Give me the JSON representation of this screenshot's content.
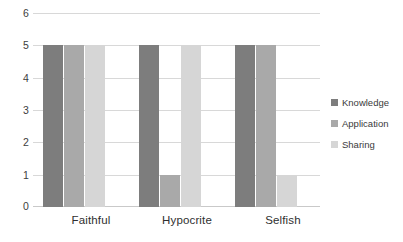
{
  "chart_data": {
    "type": "bar",
    "title": "",
    "subtitle": "",
    "xlabel": "",
    "ylabel": "",
    "categories": [
      "Faithful",
      "Hypocrite",
      "Selfish"
    ],
    "series": [
      {
        "name": "Knowledge",
        "color": "#7d7d7d",
        "values": [
          5,
          5,
          5
        ]
      },
      {
        "name": "Application",
        "color": "#a9a9a9",
        "values": [
          5,
          1,
          5
        ]
      },
      {
        "name": "Sharing",
        "color": "#d6d6d6",
        "values": [
          5,
          5,
          1
        ]
      }
    ],
    "ylim": [
      0,
      6
    ],
    "y_ticks": [
      0,
      1,
      2,
      3,
      4,
      5,
      6
    ],
    "y_tick_labels": [
      "0",
      "1",
      "2",
      "3",
      "4",
      "5",
      "6"
    ],
    "grid": true,
    "grid_axis": "y",
    "legend_position": "right",
    "background": "#ffffff",
    "gridline_color": "#d8d8d8"
  },
  "axes": {
    "y_labels": [
      "6",
      "5",
      "4",
      "3",
      "2",
      "1",
      "0"
    ]
  },
  "legend": {
    "items": [
      {
        "label": "Knowledge"
      },
      {
        "label": "Application"
      },
      {
        "label": "Sharing"
      }
    ]
  }
}
